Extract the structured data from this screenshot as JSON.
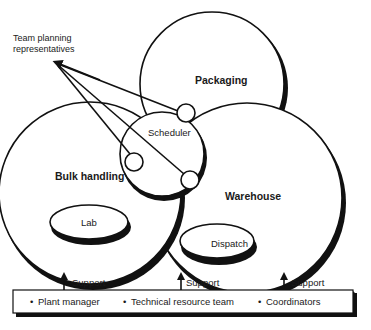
{
  "diagram": {
    "annotation": {
      "line1": "Team planning",
      "line2": "representatives"
    },
    "circles": {
      "packaging": "Packaging",
      "bulk_handling": "Bulk handling",
      "warehouse": "Warehouse",
      "scheduler": "Scheduler"
    },
    "sub_units": {
      "lab": "Lab",
      "dispatch": "Dispatch"
    },
    "support_arrows": [
      {
        "label": "Support"
      },
      {
        "label": "Support"
      },
      {
        "label": "Support"
      }
    ],
    "support_box": {
      "items": [
        {
          "bullet": "•",
          "label": "Plant manager"
        },
        {
          "bullet": "•",
          "label": "Technical resource team"
        },
        {
          "bullet": "•",
          "label": "Coordinators"
        }
      ]
    }
  }
}
